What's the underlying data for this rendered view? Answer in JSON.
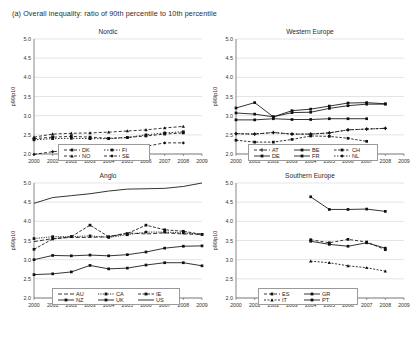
{
  "figure": {
    "caption": "(a) Overall inequality: ratio of 90th percentile to 10th percentile"
  },
  "chart_data": [
    {
      "type": "line",
      "title": "Nordic",
      "xlabel": "",
      "ylabel": "p90/p10",
      "x": [
        2000,
        2001,
        2002,
        2003,
        2004,
        2005,
        2006,
        2007,
        2008,
        2009
      ],
      "xlim": [
        2000,
        2009
      ],
      "ylim": [
        2.0,
        5.0
      ],
      "yticks": [
        "2.0",
        "2.5",
        "3.0",
        "3.5",
        "4.0",
        "4.5",
        "5.0"
      ],
      "xticks": [
        "2000",
        "2001",
        "2002",
        "2003",
        "2004",
        "2005",
        "2006",
        "2007",
        "2008",
        "2009"
      ],
      "grid": true,
      "legend_position": "bottom",
      "series": [
        {
          "name": "DK",
          "values": [
            2.4,
            2.44,
            2.46,
            2.44,
            2.41,
            2.43,
            2.47,
            2.52,
            2.55,
            null
          ]
        },
        {
          "name": "FI",
          "values": [
            2.37,
            2.4,
            2.41,
            2.4,
            2.4,
            2.43,
            2.5,
            2.55,
            2.58,
            null
          ]
        },
        {
          "name": "NO",
          "values": [
            2.44,
            2.52,
            2.54,
            2.55,
            2.57,
            2.6,
            2.63,
            2.68,
            2.72,
            null
          ]
        },
        {
          "name": "SE",
          "values": [
            1.99,
            2.06,
            2.09,
            2.09,
            2.1,
            2.11,
            2.2,
            2.29,
            2.29,
            null
          ]
        }
      ]
    },
    {
      "type": "line",
      "title": "Western Europe",
      "xlabel": "",
      "ylabel": "p90/p10",
      "x": [
        2000,
        2001,
        2002,
        2003,
        2004,
        2005,
        2006,
        2007,
        2008,
        2009
      ],
      "xlim": [
        2000,
        2009
      ],
      "ylim": [
        2.0,
        5.0
      ],
      "yticks": [
        "2.0",
        "2.5",
        "3.0",
        "3.5",
        "4.0",
        "4.5",
        "5.0"
      ],
      "xticks": [
        "2000",
        "2001",
        "2002",
        "2003",
        "2004",
        "2005",
        "2006",
        "2007",
        "2008",
        "2009"
      ],
      "grid": true,
      "legend_position": "bottom",
      "series": [
        {
          "name": "AT",
          "values": [
            2.53,
            2.52,
            2.56,
            2.52,
            2.52,
            2.55,
            2.63,
            2.65,
            2.67,
            null
          ]
        },
        {
          "name": "BE",
          "values": [
            2.89,
            2.89,
            2.92,
            2.9,
            2.9,
            2.92,
            2.92,
            2.92,
            null,
            null
          ]
        },
        {
          "name": "CH",
          "values": [
            2.36,
            2.31,
            2.31,
            2.38,
            2.47,
            2.46,
            2.41,
            2.33,
            null,
            null
          ]
        },
        {
          "name": "DE",
          "values": [
            3.07,
            3.04,
            2.97,
            3.08,
            3.09,
            3.19,
            3.26,
            3.3,
            3.3,
            null
          ]
        },
        {
          "name": "FR",
          "values": [
            3.2,
            3.34,
            2.97,
            3.13,
            3.17,
            3.25,
            3.33,
            3.34,
            3.31,
            null
          ]
        },
        {
          "name": "NL",
          "values": [
            2.53,
            2.52,
            2.56,
            2.52,
            2.52,
            2.55,
            2.63,
            2.65,
            2.67,
            null
          ]
        }
      ]
    },
    {
      "type": "line",
      "title": "Anglo",
      "xlabel": "",
      "ylabel": "p90/p10",
      "x": [
        2000,
        2001,
        2002,
        2003,
        2004,
        2005,
        2006,
        2007,
        2008,
        2009
      ],
      "xlim": [
        2000,
        2009
      ],
      "ylim": [
        2.0,
        5.0
      ],
      "yticks": [
        "2.0",
        "2.5",
        "3.0",
        "3.5",
        "4.0",
        "4.5",
        "5.0"
      ],
      "xticks": [
        "2000",
        "2001",
        "2002",
        "2003",
        "2004",
        "2005",
        "2006",
        "2007",
        "2008",
        "2009"
      ],
      "grid": true,
      "legend_position": "bottom",
      "series": [
        {
          "name": "AU",
          "values": [
            3.47,
            3.55,
            3.58,
            3.58,
            3.6,
            3.7,
            3.67,
            3.7,
            3.67,
            3.66
          ]
        },
        {
          "name": "CA",
          "values": [
            3.55,
            3.6,
            3.6,
            3.62,
            3.58,
            3.65,
            3.72,
            3.72,
            3.7,
            3.66
          ]
        },
        {
          "name": "IE",
          "values": [
            3.27,
            3.54,
            3.6,
            3.9,
            3.6,
            3.68,
            3.9,
            3.78,
            3.74,
            3.66
          ]
        },
        {
          "name": "NZ",
          "values": [
            3.0,
            3.11,
            3.1,
            3.12,
            3.1,
            3.13,
            3.2,
            3.3,
            3.35,
            3.36
          ]
        },
        {
          "name": "UK",
          "values": [
            2.61,
            2.63,
            2.68,
            2.85,
            2.76,
            2.78,
            2.86,
            2.92,
            2.92,
            2.84
          ]
        },
        {
          "name": "US",
          "values": [
            4.47,
            4.62,
            4.67,
            4.72,
            4.79,
            4.84,
            4.85,
            4.86,
            4.91,
            5.0
          ]
        }
      ]
    },
    {
      "type": "line",
      "title": "Southern Europe",
      "xlabel": "",
      "ylabel": "p90/p10",
      "x": [
        2000,
        2001,
        2002,
        2003,
        2004,
        2005,
        2006,
        2007,
        2008,
        2009
      ],
      "xlim": [
        2000,
        2009
      ],
      "ylim": [
        2.0,
        5.0
      ],
      "yticks": [
        "2.0",
        "2.5",
        "3.0",
        "3.5",
        "4.0",
        "4.5",
        "5.0"
      ],
      "xticks": [
        "2000",
        "2001",
        "2002",
        "2003",
        "2004",
        "2005",
        "2006",
        "2007",
        "2008",
        "2009"
      ],
      "grid": true,
      "legend_position": "bottom",
      "series": [
        {
          "name": "ES",
          "values": [
            null,
            null,
            null,
            null,
            3.52,
            3.44,
            3.53,
            3.46,
            3.26,
            null
          ]
        },
        {
          "name": "GR",
          "values": [
            null,
            null,
            null,
            null,
            4.64,
            4.31,
            4.31,
            4.32,
            4.26,
            null
          ]
        },
        {
          "name": "IT",
          "values": [
            null,
            null,
            null,
            null,
            2.96,
            2.92,
            2.84,
            2.79,
            2.7,
            null
          ]
        },
        {
          "name": "PT",
          "values": [
            null,
            null,
            null,
            null,
            3.48,
            3.4,
            3.35,
            3.44,
            3.3,
            null
          ]
        }
      ]
    }
  ],
  "legends": {
    "nordic": [
      "DK",
      "FI",
      "NO",
      "SE"
    ],
    "west": [
      "AT",
      "BE",
      "CH",
      "DE",
      "FR",
      "NL"
    ],
    "anglo": [
      "AU",
      "CA",
      "IE",
      "NZ",
      "UK",
      "US"
    ],
    "south": [
      "ES",
      "GR",
      "IT",
      "PT"
    ]
  }
}
